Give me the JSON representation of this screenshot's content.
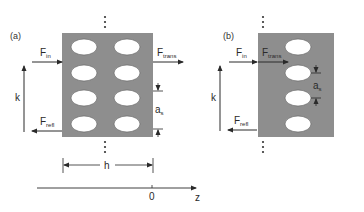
{
  "figure": {
    "colors": {
      "slab": "#8e8e8e",
      "hole": "#ffffff",
      "line": "#2a2a2a"
    },
    "panel_a": {
      "label": "(a)",
      "f_in": {
        "main": "F",
        "sub": "in"
      },
      "f_trans": {
        "main": "F",
        "sub": "trans"
      },
      "f_refl": {
        "main": "F",
        "sub": "refl"
      },
      "k_label": "k",
      "spacing_label": {
        "main": "a",
        "sub": "s"
      },
      "width_label": "h",
      "hole_columns": 2,
      "hole_rows": 4
    },
    "panel_b": {
      "label": "(b)",
      "f_in": {
        "main": "F",
        "sub": "in"
      },
      "f_trans": {
        "main": "F",
        "sub": "trans"
      },
      "f_refl": {
        "main": "F",
        "sub": "refl"
      },
      "k_label": "k",
      "spacing_label": {
        "main": "a",
        "sub": "s"
      },
      "hole_columns": 1,
      "hole_rows": 4
    },
    "z_axis": {
      "origin_label": "0",
      "axis_label": "z"
    },
    "continuation": "⋮"
  }
}
